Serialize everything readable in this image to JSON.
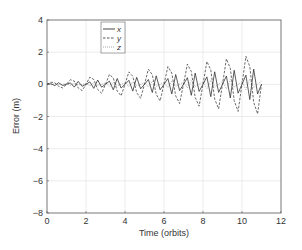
{
  "chart_data": {
    "type": "line",
    "title": "",
    "xlabel": "Time  (orbits)",
    "ylabel": "Error  (m)",
    "xlim": [
      0,
      12
    ],
    "ylim": [
      -8,
      4
    ],
    "xticks": [
      0,
      2,
      4,
      6,
      8,
      10,
      12
    ],
    "yticks": [
      -8,
      -6,
      -4,
      -2,
      0,
      2,
      4
    ],
    "grid": true,
    "legend_position": "upper-left-inside",
    "x": [
      0,
      0.2,
      0.4,
      0.6,
      0.8,
      1.0,
      1.2,
      1.4,
      1.6,
      1.8,
      2.0,
      2.2,
      2.4,
      2.6,
      2.8,
      3.0,
      3.2,
      3.4,
      3.6,
      3.8,
      4.0,
      4.2,
      4.4,
      4.6,
      4.8,
      5.0,
      5.2,
      5.4,
      5.6,
      5.8,
      6.0,
      6.2,
      6.4,
      6.6,
      6.8,
      7.0,
      7.2,
      7.4,
      7.6,
      7.8,
      8.0,
      8.2,
      8.4,
      8.6,
      8.8,
      9.0,
      9.2,
      9.4,
      9.6,
      9.8,
      10.0,
      10.2,
      10.4,
      10.6,
      10.8,
      11.0
    ],
    "series": [
      {
        "name": "x",
        "style": "solid",
        "color": "#333333",
        "values": [
          0,
          0.04,
          -0.08,
          0.1,
          -0.07,
          0,
          0.09,
          -0.17,
          0.18,
          -0.12,
          0,
          0.15,
          -0.25,
          0.27,
          -0.18,
          0,
          0.2,
          -0.34,
          0.36,
          -0.23,
          0,
          0.25,
          -0.42,
          0.44,
          -0.28,
          0,
          0.3,
          -0.51,
          0.53,
          -0.34,
          0,
          0.36,
          -0.6,
          0.61,
          -0.39,
          0,
          0.41,
          -0.68,
          0.7,
          -0.44,
          0,
          0.46,
          -0.77,
          0.78,
          -0.5,
          0,
          0.52,
          -0.85,
          0.87,
          -0.55,
          0,
          0.57,
          -0.94,
          0.95,
          -0.6,
          0
        ]
      },
      {
        "name": "y",
        "style": "dashed",
        "color": "#444444",
        "values": [
          0,
          0.13,
          0.1,
          -0.12,
          -0.22,
          0,
          0.29,
          0.2,
          -0.22,
          -0.39,
          0,
          0.45,
          0.3,
          -0.32,
          -0.55,
          0,
          0.61,
          0.4,
          -0.42,
          -0.71,
          0,
          0.77,
          0.5,
          -0.52,
          -0.87,
          0,
          0.94,
          0.6,
          -0.62,
          -1.03,
          0,
          1.1,
          0.7,
          -0.72,
          -1.19,
          0,
          1.26,
          0.8,
          -0.82,
          -1.36,
          0,
          1.42,
          0.9,
          -0.92,
          -1.52,
          0,
          1.58,
          1.0,
          -1.02,
          -1.68,
          0,
          1.74,
          1.1,
          -1.12,
          -1.84,
          0
        ]
      },
      {
        "name": "z",
        "style": "dotted",
        "color": "#888888",
        "values": [
          0.02,
          -0.03,
          0.04,
          -0.03,
          0,
          0.04,
          -0.06,
          0.07,
          -0.05,
          0,
          0.05,
          -0.09,
          0.1,
          -0.06,
          0,
          0.07,
          -0.12,
          0.13,
          -0.08,
          0,
          0.09,
          -0.15,
          0.15,
          -0.1,
          0,
          0.11,
          -0.18,
          0.18,
          -0.12,
          0,
          0.12,
          -0.21,
          0.21,
          -0.13,
          0,
          0.14,
          -0.23,
          0.24,
          -0.15,
          0,
          0.16,
          -0.26,
          0.27,
          -0.17,
          0,
          0.18,
          -0.29,
          0.3,
          -0.19,
          0,
          0.19,
          -0.32,
          0.33,
          -0.2,
          0,
          0.21
        ]
      }
    ]
  },
  "legend": {
    "items": [
      {
        "label": "x",
        "style": "solid"
      },
      {
        "label": "y",
        "style": "dashed"
      },
      {
        "label": "z",
        "style": "dotted"
      }
    ]
  },
  "colors": {
    "axis": "#555555",
    "grid": "#e4e4e4",
    "text": "#333333",
    "background": "#ffffff"
  }
}
